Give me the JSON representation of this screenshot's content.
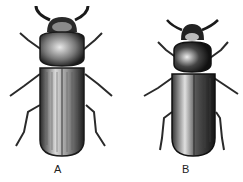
{
  "figure": {
    "panels": [
      {
        "id": "A",
        "label": "A",
        "subject": "beetle-dorsal-view",
        "colors": {
          "ink": "#1a1a1a",
          "shade": "#6b6b6b",
          "paper": "#ffffff"
        }
      },
      {
        "id": "B",
        "label": "B",
        "subject": "beetle-dorsal-view",
        "colors": {
          "ink": "#1a1a1a",
          "shade": "#6b6b6b",
          "paper": "#ffffff"
        }
      }
    ]
  }
}
